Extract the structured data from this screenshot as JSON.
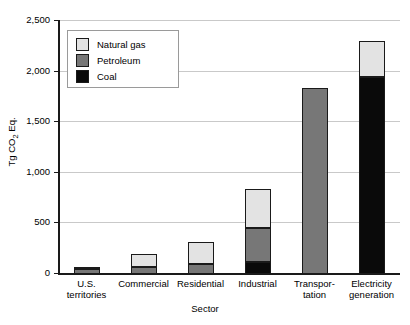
{
  "chart_data": {
    "type": "bar",
    "title": "",
    "subtitle": "",
    "xlabel": "Sector",
    "ylabel": "Tg CO2 Eq.",
    "ylabel_parts": {
      "prefix": "Tg CO",
      "sub": "2",
      "suffix": " Eq."
    },
    "ylim": [
      0,
      2500
    ],
    "ytick_values": [
      0,
      500,
      1000,
      1500,
      2000,
      2500
    ],
    "ytick_labels": [
      "0",
      "500",
      "1,000",
      "1,500",
      "2,000",
      "2,500"
    ],
    "grid": true,
    "grid_axis": "y",
    "stacked": true,
    "legend_position": "upper-left-inside",
    "categories": [
      "U.S.\nterritories",
      "Commercial",
      "Residential",
      "Industrial",
      "Transpor-\ntation",
      "Electricity\ngeneration"
    ],
    "category_plain": [
      "U.S. territories",
      "Commercial",
      "Residential",
      "Industrial",
      "Transportation",
      "Electricity generation"
    ],
    "series": [
      {
        "name": "Coal",
        "color": "#0a0a0a",
        "values": [
          0,
          5,
          5,
          120,
          0,
          1950
        ]
      },
      {
        "name": "Petroleum",
        "color": "#777777",
        "values": [
          48,
          60,
          90,
          330,
          1840,
          0
        ]
      },
      {
        "name": "Natural gas",
        "color": "#e3e3e3",
        "values": [
          2,
          135,
          225,
          390,
          0,
          350
        ]
      }
    ],
    "totals": [
      50,
      200,
      320,
      840,
      1840,
      2300
    ]
  },
  "legend": {
    "entries": [
      {
        "label": "Natural gas",
        "color": "#e3e3e3"
      },
      {
        "label": "Petroleum",
        "color": "#777777"
      },
      {
        "label": "Coal",
        "color": "#0a0a0a"
      }
    ]
  }
}
